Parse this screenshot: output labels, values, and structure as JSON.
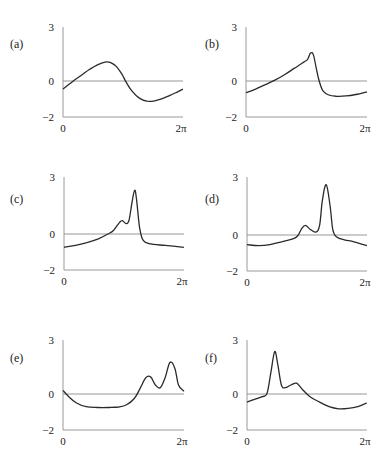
{
  "figure": {
    "panels": [
      {
        "id": "a",
        "label": "(a)",
        "y_top": "3",
        "y_zero": "0",
        "y_bottom": "−2",
        "x_left": "0",
        "x_right": "2π"
      },
      {
        "id": "b",
        "label": "(b)",
        "y_top": "3",
        "y_zero": "0",
        "y_bottom": "−2",
        "x_left": "0",
        "x_right": "2π"
      },
      {
        "id": "c",
        "label": "(c)",
        "y_top": "3",
        "y_zero": "0",
        "y_bottom": "−2",
        "x_left": "0",
        "x_right": "2π"
      },
      {
        "id": "d",
        "label": "(d)",
        "y_top": "3",
        "y_zero": "0",
        "y_bottom": "−2",
        "x_left": "0",
        "x_right": "2π"
      },
      {
        "id": "e",
        "label": "(e)",
        "y_top": "3",
        "y_zero": "0",
        "y_bottom": "−2",
        "x_left": "0",
        "x_right": "2π"
      },
      {
        "id": "f",
        "label": "(f)",
        "y_top": "3",
        "y_zero": "0",
        "y_bottom": "−2",
        "x_left": "0",
        "x_right": "2π"
      }
    ]
  },
  "chart_data": [
    {
      "type": "line",
      "panel": "(a)",
      "title": "",
      "xlabel": "",
      "ylabel": "",
      "xlim": [
        0,
        6.283
      ],
      "ylim": [
        -2,
        3
      ],
      "xticks": [
        "0",
        "2π"
      ],
      "yticks": [
        "-2",
        "0",
        "3"
      ],
      "grid": false,
      "reference_line_y": 0,
      "x": [
        0,
        0.3,
        0.6,
        1.0,
        1.4,
        1.8,
        2.2,
        2.5,
        2.8,
        3.1,
        3.3,
        3.6,
        4.0,
        4.4,
        4.8,
        5.2,
        5.6,
        6.0,
        6.28
      ],
      "y": [
        -0.45,
        -0.2,
        0.05,
        0.35,
        0.65,
        0.9,
        1.05,
        1.02,
        0.8,
        0.35,
        -0.05,
        -0.55,
        -0.95,
        -1.12,
        -1.1,
        -0.98,
        -0.8,
        -0.6,
        -0.45
      ]
    },
    {
      "type": "line",
      "panel": "(b)",
      "title": "",
      "xlabel": "",
      "ylabel": "",
      "xlim": [
        0,
        6.283
      ],
      "ylim": [
        -2,
        3
      ],
      "xticks": [
        "0",
        "2π"
      ],
      "yticks": [
        "-2",
        "0",
        "3"
      ],
      "grid": false,
      "reference_line_y": 0,
      "x": [
        0,
        0.5,
        1.0,
        1.5,
        2.0,
        2.5,
        2.8,
        3.0,
        3.2,
        3.35,
        3.5,
        3.65,
        3.8,
        4.0,
        4.3,
        4.7,
        5.2,
        5.7,
        6.28
      ],
      "y": [
        -0.65,
        -0.45,
        -0.2,
        0.05,
        0.35,
        0.7,
        0.9,
        1.05,
        1.2,
        1.55,
        1.45,
        0.7,
        0.0,
        -0.55,
        -0.78,
        -0.85,
        -0.83,
        -0.75,
        -0.6
      ]
    },
    {
      "type": "line",
      "panel": "(c)",
      "title": "",
      "xlabel": "",
      "ylabel": "",
      "xlim": [
        0,
        6.283
      ],
      "ylim": [
        -2,
        3
      ],
      "xticks": [
        "0",
        "2π"
      ],
      "yticks": [
        "-2",
        "0",
        "3"
      ],
      "grid": false,
      "reference_line_y": 0,
      "x": [
        0,
        0.6,
        1.2,
        1.8,
        2.3,
        2.6,
        2.9,
        3.05,
        3.25,
        3.4,
        3.55,
        3.7,
        3.8,
        3.95,
        4.1,
        4.3,
        4.7,
        5.3,
        6.28
      ],
      "y": [
        -0.7,
        -0.6,
        -0.45,
        -0.25,
        0.0,
        0.2,
        0.6,
        0.7,
        0.55,
        0.7,
        1.6,
        2.3,
        1.8,
        0.4,
        -0.25,
        -0.45,
        -0.55,
        -0.6,
        -0.7
      ]
    },
    {
      "type": "line",
      "panel": "(d)",
      "title": "",
      "xlabel": "",
      "ylabel": "",
      "xlim": [
        0,
        6.283
      ],
      "ylim": [
        -2,
        3
      ],
      "xticks": [
        "0",
        "2π"
      ],
      "yticks": [
        "-2",
        "0",
        "3"
      ],
      "grid": false,
      "reference_line_y": 0,
      "x": [
        0,
        0.6,
        1.2,
        1.8,
        2.4,
        2.65,
        2.85,
        3.05,
        3.3,
        3.6,
        3.8,
        3.95,
        4.15,
        4.35,
        4.5,
        4.7,
        5.1,
        5.6,
        6.28
      ],
      "y": [
        -0.5,
        -0.55,
        -0.5,
        -0.35,
        -0.2,
        -0.05,
        0.3,
        0.5,
        0.3,
        0.15,
        0.5,
        1.8,
        2.6,
        1.5,
        0.25,
        -0.1,
        -0.25,
        -0.35,
        -0.55
      ]
    },
    {
      "type": "line",
      "panel": "(e)",
      "title": "",
      "xlabel": "",
      "ylabel": "",
      "xlim": [
        0,
        6.283
      ],
      "ylim": [
        -2,
        3
      ],
      "xticks": [
        "0",
        "2π"
      ],
      "yticks": [
        "-2",
        "0",
        "3"
      ],
      "grid": false,
      "reference_line_y": 0,
      "x": [
        0,
        0.3,
        0.7,
        1.2,
        1.8,
        2.4,
        2.9,
        3.3,
        3.7,
        4.0,
        4.3,
        4.55,
        4.8,
        5.05,
        5.3,
        5.55,
        5.8,
        6.0,
        6.28
      ],
      "y": [
        0.2,
        -0.15,
        -0.5,
        -0.7,
        -0.75,
        -0.75,
        -0.72,
        -0.6,
        -0.25,
        0.3,
        0.9,
        0.95,
        0.5,
        0.35,
        0.9,
        1.75,
        1.45,
        0.5,
        0.15
      ]
    },
    {
      "type": "line",
      "panel": "(f)",
      "title": "",
      "xlabel": "",
      "ylabel": "",
      "xlim": [
        0,
        6.283
      ],
      "ylim": [
        -2,
        3
      ],
      "xticks": [
        "0",
        "2π"
      ],
      "yticks": [
        "-2",
        "0",
        "3"
      ],
      "grid": false,
      "reference_line_y": 0,
      "x": [
        0,
        0.4,
        0.8,
        1.05,
        1.25,
        1.45,
        1.6,
        1.8,
        2.0,
        2.3,
        2.6,
        2.9,
        3.3,
        3.8,
        4.3,
        4.8,
        5.3,
        5.8,
        6.28
      ],
      "y": [
        -0.45,
        -0.3,
        -0.15,
        0.05,
        1.2,
        2.35,
        1.7,
        0.5,
        0.35,
        0.5,
        0.6,
        0.25,
        -0.15,
        -0.45,
        -0.7,
        -0.82,
        -0.8,
        -0.7,
        -0.5
      ]
    }
  ]
}
